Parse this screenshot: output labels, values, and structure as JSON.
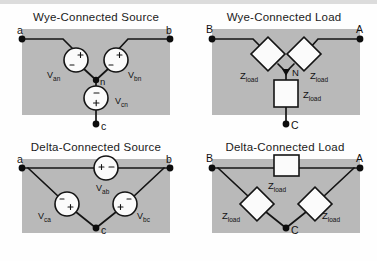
{
  "figure": {
    "background_color": "#fefefe",
    "panel_color": "#b9b9b9",
    "line_color": "#141414",
    "component_fill": "#fbfbfb"
  },
  "quadrants": [
    {
      "id": "wye-source",
      "title": "Wye-Connected Source",
      "type": "wye",
      "role": "source",
      "terminals": [
        "a",
        "b",
        "c"
      ],
      "neutral": "n",
      "components": [
        {
          "label": "V",
          "sub": "an",
          "shape": "circle",
          "polarity": "diagonal"
        },
        {
          "label": "V",
          "sub": "bn",
          "shape": "circle",
          "polarity": "diagonal"
        },
        {
          "label": "V",
          "sub": "cn",
          "shape": "circle",
          "polarity": "vertical",
          "plus": "bottom",
          "minus": "top"
        }
      ]
    },
    {
      "id": "wye-load",
      "title": "Wye-Connected Load",
      "type": "wye",
      "role": "load",
      "terminals": [
        "B",
        "A",
        "C"
      ],
      "neutral": "N",
      "components": [
        {
          "label": "Z",
          "sub": "load",
          "shape": "diamond"
        },
        {
          "label": "Z",
          "sub": "load",
          "shape": "diamond"
        },
        {
          "label": "Z",
          "sub": "load",
          "shape": "rectangle"
        }
      ]
    },
    {
      "id": "delta-source",
      "title": "Delta-Connected Source",
      "type": "delta",
      "role": "source",
      "terminals": [
        "a",
        "b",
        "c"
      ],
      "components": [
        {
          "label": "V",
          "sub": "ab",
          "shape": "circle",
          "polarity": "horizontal"
        },
        {
          "label": "V",
          "sub": "ca",
          "shape": "circle",
          "polarity": "diagonal"
        },
        {
          "label": "V",
          "sub": "bc",
          "shape": "circle",
          "polarity": "diagonal"
        }
      ]
    },
    {
      "id": "delta-load",
      "title": "Delta-Connected Load",
      "type": "delta",
      "role": "load",
      "terminals": [
        "B",
        "A",
        "C"
      ],
      "components": [
        {
          "label": "Z",
          "sub": "load",
          "shape": "rectangle"
        },
        {
          "label": "Z",
          "sub": "load",
          "shape": "diamond"
        },
        {
          "label": "Z",
          "sub": "load",
          "shape": "diamond"
        }
      ]
    }
  ],
  "labels": {
    "wye_source_title": "Wye-Connected Source",
    "wye_load_title": "Wye-Connected Load",
    "delta_source_title": "Delta-Connected Source",
    "delta_load_title": "Delta-Connected Load",
    "term_a_lower": "a",
    "term_b_lower": "b",
    "term_c_lower": "c",
    "term_a_upper": "A",
    "term_b_upper": "B",
    "term_c_upper": "C",
    "neutral_lower": "n",
    "neutral_upper": "N",
    "v_an": "V",
    "v_an_sub": "an",
    "v_bn": "V",
    "v_bn_sub": "bn",
    "v_cn": "V",
    "v_cn_sub": "cn",
    "v_ab": "V",
    "v_ab_sub": "ab",
    "v_ca": "V",
    "v_ca_sub": "ca",
    "v_bc": "V",
    "v_bc_sub": "bc",
    "z": "Z",
    "z_sub": "load"
  }
}
